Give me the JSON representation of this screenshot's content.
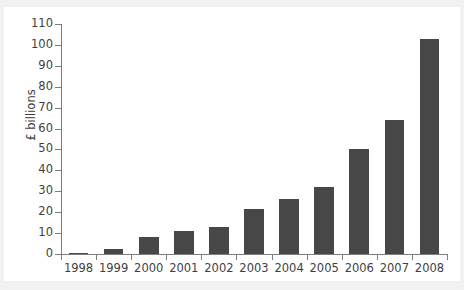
{
  "chart_data": {
    "type": "bar",
    "title": "",
    "xlabel": "",
    "ylabel": "£ billions",
    "categories": [
      "1998",
      "1999",
      "2000",
      "2001",
      "2002",
      "2003",
      "2004",
      "2005",
      "2006",
      "2007",
      "2008"
    ],
    "values": [
      0.5,
      2.5,
      8,
      11,
      13,
      21.5,
      26.5,
      32,
      50,
      64,
      103
    ],
    "ylim": [
      0,
      110
    ],
    "ytick_labels": [
      "0",
      "10",
      "20",
      "30",
      "40",
      "50",
      "60",
      "70",
      "80",
      "90",
      "100",
      "110"
    ],
    "ytick_values": [
      0,
      10,
      20,
      30,
      40,
      50,
      60,
      70,
      80,
      90,
      100,
      110
    ],
    "grid": false,
    "legend": false,
    "legend_position": "none",
    "bar_color": "#474747",
    "axis_color": "#7d7d7d",
    "text_color": "#3f3f3f",
    "background_color": "#ffffff"
  }
}
